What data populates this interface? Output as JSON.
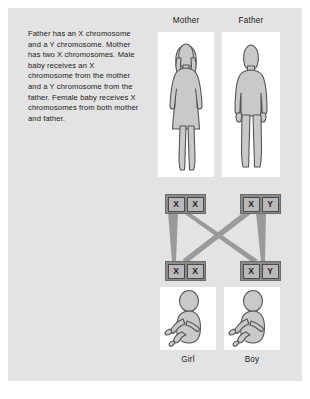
{
  "diagram": {
    "caption": "Father has an X chromosome and a Y chromosome. Mother has two X chromosomes. Male baby receives an X chromosome from the mother and a Y chromosome from the father. Female baby receives X chromosomes from both mother and father.",
    "background_color": "#e3e3e3",
    "card_color": "#ffffff",
    "silhouette_color": "#c9c9c9",
    "silhouette_outline": "#4f4f4f",
    "connector_color": "#9a9a9a",
    "chromosome_box_color": "#8a8a8a",
    "chromosome_cell_color": "#b9b9b9"
  },
  "parents": {
    "mother": {
      "label": "Mother",
      "icon": "adult-female-silhouette-icon",
      "chromosomes": [
        "X",
        "X"
      ]
    },
    "father": {
      "label": "Father",
      "icon": "adult-male-silhouette-icon",
      "chromosomes": [
        "X",
        "Y"
      ]
    }
  },
  "children": {
    "girl": {
      "label": "Girl",
      "icon": "baby-silhouette-icon",
      "chromosomes": [
        "X",
        "X"
      ]
    },
    "boy": {
      "label": "Boy",
      "icon": "baby-silhouette-icon",
      "chromosomes": [
        "X",
        "Y"
      ]
    }
  },
  "inheritance_paths": [
    {
      "from": "mother",
      "from_allele": "X",
      "to": "girl",
      "to_allele": "X",
      "kind": "straight"
    },
    {
      "from": "father",
      "from_allele": "X",
      "to": "girl",
      "to_allele": "X",
      "kind": "crossing"
    },
    {
      "from": "mother",
      "from_allele": "X",
      "to": "boy",
      "to_allele": "X",
      "kind": "crossing"
    },
    {
      "from": "father",
      "from_allele": "Y",
      "to": "boy",
      "to_allele": "Y",
      "kind": "straight"
    }
  ]
}
